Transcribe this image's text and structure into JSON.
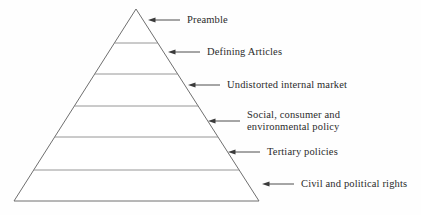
{
  "diagram": {
    "type": "pyramid-hierarchy",
    "title": "",
    "background_color": "#fefefe",
    "line_color": "#6f6f6f",
    "divider_color": "#8a8a8a",
    "text_color": "#2b2b2b",
    "arrow_color": "#3a3a3a",
    "apex": {
      "x": 136,
      "y": 9
    },
    "base_left": {
      "x": 14,
      "y": 201
    },
    "base_right": {
      "x": 259,
      "y": 201
    },
    "tiers": [
      {
        "index": 1,
        "label": "Preamble",
        "label_lines": [
          "Preamble"
        ],
        "divider_y": 43,
        "arrow_tip_x": 148,
        "arrow_tail_x": 180,
        "arrow_y": 20,
        "text_x": 187,
        "text_y": 14
      },
      {
        "index": 2,
        "label": "Defining Articles",
        "label_lines": [
          "Defining Articles"
        ],
        "divider_y": 74,
        "arrow_tip_x": 168,
        "arrow_tail_x": 200,
        "arrow_y": 52,
        "text_x": 207,
        "text_y": 46
      },
      {
        "index": 3,
        "label": "Undistorted internal market",
        "label_lines": [
          "Undistorted internal market"
        ],
        "divider_y": 106,
        "arrow_tip_x": 188,
        "arrow_tail_x": 220,
        "arrow_y": 85,
        "text_x": 227,
        "text_y": 79
      },
      {
        "index": 4,
        "label": "Social, consumer and environmental policy",
        "label_lines": [
          "Social, consumer and",
          "environmental policy"
        ],
        "divider_y": 137,
        "arrow_tip_x": 208,
        "arrow_tail_x": 240,
        "arrow_y": 121,
        "text_x": 247,
        "text_y": 109
      },
      {
        "index": 5,
        "label": "Tertiary policies",
        "label_lines": [
          "Tertiary policies"
        ],
        "divider_y": 170,
        "arrow_tip_x": 228,
        "arrow_tail_x": 260,
        "arrow_y": 152,
        "text_x": 267,
        "text_y": 146
      },
      {
        "index": 6,
        "label": "Civil and political rights",
        "label_lines": [
          "Civil and political rights"
        ],
        "divider_y": null,
        "arrow_tip_x": 262,
        "arrow_tail_x": 294,
        "arrow_y": 184,
        "text_x": 301,
        "text_y": 178
      }
    ]
  }
}
